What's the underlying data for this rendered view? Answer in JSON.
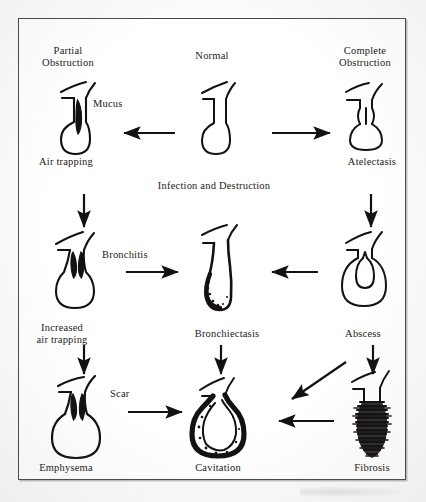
{
  "diagram": {
    "ink_color": "#141210",
    "paper_color": "#ffffff",
    "frame_color": "#4a4a4a"
  },
  "headings": {
    "partial_obstruction": "Partial\nObstruction",
    "normal": "Normal",
    "complete_obstruction": "Complete\nObstruction",
    "infection_and_destruction": "Infection and Destruction"
  },
  "labels": {
    "mucus": "Mucus",
    "air_trapping": "Air trapping",
    "atelectasis": "Atelectasis",
    "bronchitis": "Bronchitis",
    "increased_air_trapping": "Increased\nair trapping",
    "bronchiectasis": "Bronchiectasis",
    "abscess": "Abscess",
    "scar": "Scar",
    "emphysema": "Emphysema",
    "cavitation": "Cavitation",
    "fibrosis": "Fibrosis"
  },
  "figures": [
    {
      "id": "partial-obstruction-airway",
      "label": "Air trapping",
      "row": 1,
      "col": 1
    },
    {
      "id": "normal-airway",
      "label": "Normal",
      "row": 1,
      "col": 2
    },
    {
      "id": "complete-obstruction-airway",
      "label": "Atelectasis",
      "row": 1,
      "col": 3
    },
    {
      "id": "bronchitis-airway",
      "label": "Increased air trapping",
      "row": 2,
      "col": 1
    },
    {
      "id": "bronchiectasis-airway",
      "label": "Bronchiectasis",
      "row": 2,
      "col": 2
    },
    {
      "id": "abscess-airway",
      "label": "Abscess",
      "row": 2,
      "col": 3
    },
    {
      "id": "emphysema-airway",
      "label": "Emphysema",
      "row": 3,
      "col": 1
    },
    {
      "id": "cavitation-airway",
      "label": "Cavitation",
      "row": 3,
      "col": 2
    },
    {
      "id": "fibrosis-airway",
      "label": "Fibrosis",
      "row": 3,
      "col": 3
    }
  ],
  "arrows": [
    {
      "id": "normal-to-partial",
      "from": "normal-airway",
      "to": "partial-obstruction-airway",
      "direction": "left"
    },
    {
      "id": "normal-to-complete",
      "from": "normal-airway",
      "to": "complete-obstruction-airway",
      "direction": "right"
    },
    {
      "id": "airtrapping-to-bronchitis",
      "from": "partial-obstruction-airway",
      "to": "bronchitis-airway",
      "direction": "down"
    },
    {
      "id": "atelectasis-to-abscess",
      "from": "complete-obstruction-airway",
      "to": "abscess-airway",
      "direction": "down"
    },
    {
      "id": "bronchitis-to-bronchiectasis",
      "from": "bronchitis-airway",
      "to": "bronchiectasis-airway",
      "direction": "right"
    },
    {
      "id": "abscess-to-bronchiectasis",
      "from": "abscess-airway",
      "to": "bronchiectasis-airway",
      "direction": "left"
    },
    {
      "id": "bronchitis-to-emphysema",
      "from": "bronchitis-airway",
      "to": "emphysema-airway",
      "direction": "down"
    },
    {
      "id": "bronchiectasis-to-cavitation",
      "from": "bronchiectasis-airway",
      "to": "cavitation-airway",
      "direction": "down"
    },
    {
      "id": "abscess-to-fibrosis",
      "from": "abscess-airway",
      "to": "fibrosis-airway",
      "direction": "down"
    },
    {
      "id": "emphysema-to-cavitation",
      "from": "emphysema-airway",
      "to": "cavitation-airway",
      "direction": "right"
    },
    {
      "id": "fibrosis-to-cavitation",
      "from": "fibrosis-airway",
      "to": "cavitation-airway",
      "direction": "left"
    },
    {
      "id": "abscess-to-cavitation-diagonal",
      "from": "abscess-airway",
      "to": "cavitation-airway",
      "direction": "diagonal-down-left"
    }
  ]
}
